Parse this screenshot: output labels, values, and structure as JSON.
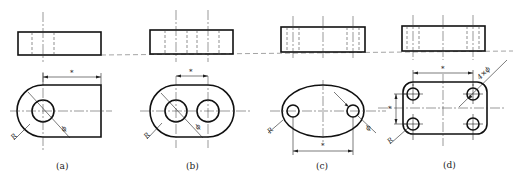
{
  "figure": {
    "colors": {
      "line": "#111111",
      "background": "#ffffff"
    },
    "panels": [
      {
        "id": "a",
        "caption": "(a)",
        "dim_star": "*",
        "radius_label": "R",
        "diameter_label": "ϕ"
      },
      {
        "id": "b",
        "caption": "(b)",
        "dim_star": "*",
        "radius_label": "R",
        "diameter_label": "ϕ"
      },
      {
        "id": "c",
        "caption": "(c)",
        "dim_star": "*",
        "radius_label": "R",
        "diameter_label": "ϕ"
      },
      {
        "id": "d",
        "caption": "(d)",
        "dim_star_h": "*",
        "dim_star_v": "*",
        "radius_label": "R",
        "hole_callout": "4×ϕ"
      }
    ]
  }
}
